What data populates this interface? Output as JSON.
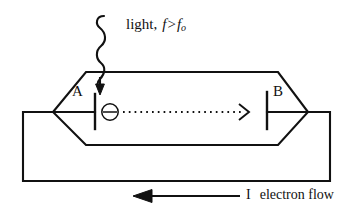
{
  "figure": {
    "type": "physics-diagram",
    "background_color": "#ffffff",
    "line_color": "#111111"
  },
  "labels": {
    "light": {
      "text": "light, f>f",
      "word": "light,",
      "f_symbol": "f",
      "relation": ">",
      "threshold_symbol": "f",
      "threshold_subscript": "o",
      "full_text": "light, f>fo"
    },
    "electrode_a": "A",
    "electrode_b": "B",
    "current_symbol": "I",
    "current_text": "electron flow"
  },
  "icons": {
    "electron": "electron-symbol",
    "light_ray": "wavy-light-ray-icon",
    "light_arrow": "down-arrow-icon",
    "electron_path_arrow": "dotted-right-arrow-icon",
    "current_arrow": "left-arrow-icon"
  },
  "geometry": {
    "tube_top_y": 72,
    "tube_bottom_y": 145,
    "tube_mid_y": 112,
    "tube_left_vertex_x": 53,
    "tube_right_vertex_x": 308,
    "circuit_left_x": 23,
    "circuit_right_x": 330,
    "circuit_bottom_y": 181
  }
}
